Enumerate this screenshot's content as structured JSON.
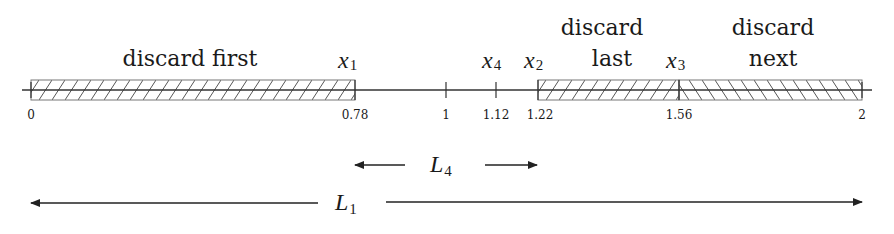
{
  "diagram": {
    "title": "",
    "axis": {
      "min": 0,
      "max": 2
    },
    "ticks": [
      {
        "value": 0,
        "label": "0"
      },
      {
        "value": 0.78,
        "label": "0.78"
      },
      {
        "value": 1,
        "label": "1"
      },
      {
        "value": 1.12,
        "label": "1.12"
      },
      {
        "value": 1.22,
        "label": "1.22"
      },
      {
        "value": 1.56,
        "label": "1.56"
      },
      {
        "value": 2,
        "label": "2"
      }
    ],
    "points": [
      {
        "name": "x",
        "sub": "1",
        "value": 0.78
      },
      {
        "name": "x",
        "sub": "4",
        "value": 1.12
      },
      {
        "name": "x",
        "sub": "2",
        "value": 1.22
      },
      {
        "name": "x",
        "sub": "3",
        "value": 1.56
      }
    ],
    "regions": [
      {
        "label_line1": "discard first",
        "label_line2": "",
        "from": 0,
        "to": 0.78,
        "hatch": "forward"
      },
      {
        "label_line1": "discard",
        "label_line2": "last",
        "from": 1.22,
        "to": 1.56,
        "hatch": "forward"
      },
      {
        "label_line1": "discard",
        "label_line2": "next",
        "from": 1.56,
        "to": 2,
        "hatch": "backward"
      }
    ],
    "intervals": [
      {
        "name": "L",
        "sub": "4",
        "from": 0.78,
        "to": 1.22
      },
      {
        "name": "L",
        "sub": "1",
        "from": 0,
        "to": 2
      }
    ],
    "colors": {
      "line": "#333333",
      "hatch": "#555555",
      "text": "#1a1a1a"
    }
  }
}
